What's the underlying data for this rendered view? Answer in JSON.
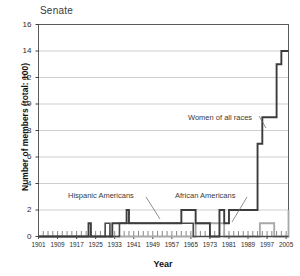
{
  "chart_data": {
    "type": "line",
    "title": "Senate",
    "xlabel": "Year",
    "ylabel": "Number of members (total: 100)",
    "xlim": [
      1901,
      2006
    ],
    "ylim": [
      0,
      16
    ],
    "ytick_step": 2,
    "yticks": [
      "0",
      "2",
      "4",
      "6",
      "8",
      "10",
      "12",
      "14",
      "16"
    ],
    "xticks": [
      "1901",
      "1909",
      "1917",
      "1925",
      "1933",
      "1941",
      "1949",
      "1957",
      "1965",
      "1973",
      "1981",
      "1989",
      "1997",
      "2005"
    ],
    "xtick_minor_step": 2,
    "grid": "horizontal",
    "legend_position": "inline-annotations",
    "annotations": [
      {
        "id": "women",
        "text": "Women of all races",
        "x_px": 188,
        "y_px": 113
      },
      {
        "id": "hispanic",
        "text": "Hispanic Americans",
        "x_px": 68,
        "y_px": 191
      },
      {
        "id": "african",
        "text": "African Americans",
        "x_px": 175,
        "y_px": 191
      }
    ],
    "series": [
      {
        "name": "Women of all races",
        "color": "#3c3c3c",
        "width": 1.9,
        "x": [
          1901,
          1921,
          1922,
          1923,
          1931,
          1932,
          1933,
          1937,
          1938,
          1939,
          1943,
          1945,
          1947,
          1949,
          1953,
          1955,
          1957,
          1959,
          1961,
          1963,
          1965,
          1967,
          1969,
          1971,
          1973,
          1975,
          1977,
          1979,
          1981,
          1983,
          1987,
          1989,
          1991,
          1992,
          1993,
          1995,
          1997,
          1999,
          2001,
          2003,
          2005,
          2006
        ],
        "values": [
          0,
          0,
          1,
          0,
          0,
          1,
          1,
          1,
          2,
          1,
          1,
          1,
          1,
          1,
          1,
          1,
          1,
          1,
          2,
          2,
          2,
          1,
          1,
          1,
          0,
          0,
          2,
          1,
          2,
          2,
          2,
          2,
          2,
          2,
          7,
          9,
          9,
          9,
          13,
          14,
          14,
          14
        ]
      },
      {
        "name": "Hispanic Americans",
        "color": "#4a4a4a",
        "width": 1.6,
        "x": [
          1901,
          1928,
          1929,
          1930,
          1931,
          1933,
          1935,
          1936,
          1937,
          1964,
          1965,
          1966,
          1967,
          1977,
          2006
        ],
        "values": [
          0,
          0,
          1,
          1,
          0,
          0,
          1,
          1,
          1,
          1,
          1,
          0,
          0,
          0,
          0
        ]
      },
      {
        "name": "African Americans",
        "color": "#a8a8a8",
        "width": 1.8,
        "x": [
          1901,
          1966,
          1967,
          1969,
          1971,
          1977,
          1979,
          1993,
          1994,
          1995,
          1997,
          1999,
          2000,
          2005,
          2006
        ],
        "values": [
          0,
          0,
          1,
          1,
          1,
          1,
          0,
          0,
          1,
          1,
          1,
          1,
          0,
          0,
          2
        ]
      }
    ]
  },
  "colors": {
    "plot_border": "#4a4a4a",
    "gridline": "#b9b9b9",
    "tick": "#2b2b2b",
    "series_women": "#3c3c3c",
    "series_hispanic": "#4a4a4a",
    "series_african": "#a8a8a8",
    "background": "#ffffff"
  }
}
